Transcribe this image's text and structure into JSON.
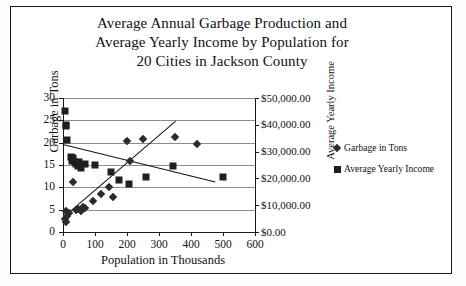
{
  "chart_data": {
    "type": "scatter",
    "title": "Average Annual Garbage Production and Average Yearly Income by Population for 20 Cities in Jackson County",
    "title_lines": [
      "Average Annual Garbage Production and",
      "Average Yearly Income by Population for",
      "20 Cities in Jackson County"
    ],
    "xlabel": "Population in Thousands",
    "ylabel": "Garbage in Tons",
    "y2label": "Average Yearly Income",
    "xlim": [
      0,
      600
    ],
    "ylim": [
      0,
      30
    ],
    "y2lim": [
      0,
      50000
    ],
    "grid": true,
    "legend_position": "right",
    "xticks": [
      0,
      100,
      200,
      300,
      400,
      500,
      600
    ],
    "xtick_labels": [
      "0",
      "100",
      "200",
      "300",
      "400",
      "500",
      "600"
    ],
    "yticks": [
      0,
      5,
      10,
      15,
      20,
      25,
      30
    ],
    "ytick_labels": [
      "0",
      "5",
      "10",
      "15",
      "20",
      "25",
      "30"
    ],
    "y2ticks": [
      0,
      10000,
      20000,
      30000,
      40000,
      50000
    ],
    "y2tick_labels": [
      "$0.00",
      "$10,000.00",
      "$20,000.00",
      "$30,000.00",
      "$40,000.00",
      "$50,000.00"
    ],
    "series": [
      {
        "name": "Garbage in Tons",
        "marker": "diamond",
        "axis": "left",
        "points": [
          {
            "x": 5,
            "y": 3.0
          },
          {
            "x": 8,
            "y": 2.3
          },
          {
            "x": 10,
            "y": 4.6
          },
          {
            "x": 14,
            "y": 3.6
          },
          {
            "x": 18,
            "y": 4.3
          },
          {
            "x": 30,
            "y": 11.2
          },
          {
            "x": 40,
            "y": 5.0
          },
          {
            "x": 48,
            "y": 5.2
          },
          {
            "x": 55,
            "y": 4.8
          },
          {
            "x": 62,
            "y": 5.6
          },
          {
            "x": 70,
            "y": 5.4
          },
          {
            "x": 95,
            "y": 7.0
          },
          {
            "x": 120,
            "y": 8.6
          },
          {
            "x": 145,
            "y": 10.1
          },
          {
            "x": 155,
            "y": 7.9
          },
          {
            "x": 200,
            "y": 20.4
          },
          {
            "x": 210,
            "y": 16.0
          },
          {
            "x": 250,
            "y": 20.9
          },
          {
            "x": 350,
            "y": 21.3
          },
          {
            "x": 420,
            "y": 19.7
          }
        ]
      },
      {
        "name": "Average Yearly Income",
        "marker": "square",
        "axis": "right",
        "points": [
          {
            "x": 5,
            "y": 45000
          },
          {
            "x": 8,
            "y": 40000
          },
          {
            "x": 10,
            "y": 39500
          },
          {
            "x": 14,
            "y": 34500
          },
          {
            "x": 25,
            "y": 28000
          },
          {
            "x": 28,
            "y": 26500
          },
          {
            "x": 32,
            "y": 27500
          },
          {
            "x": 36,
            "y": 26000
          },
          {
            "x": 42,
            "y": 25500
          },
          {
            "x": 46,
            "y": 24500
          },
          {
            "x": 50,
            "y": 26000
          },
          {
            "x": 55,
            "y": 24000
          },
          {
            "x": 70,
            "y": 25500
          },
          {
            "x": 100,
            "y": 25000
          },
          {
            "x": 150,
            "y": 22500
          },
          {
            "x": 175,
            "y": 19500
          },
          {
            "x": 205,
            "y": 18000
          },
          {
            "x": 260,
            "y": 20500
          },
          {
            "x": 345,
            "y": 24500
          },
          {
            "x": 500,
            "y": 20500
          }
        ]
      }
    ],
    "trendlines": [
      {
        "name": "garbage-trend",
        "axis": "left",
        "x0": 0,
        "y0": 3.3,
        "x1": 350,
        "y1": 24.8
      },
      {
        "name": "income-trend",
        "axis": "left",
        "x0": 0,
        "y0": 19.7,
        "x1": 475,
        "y1": 11.3
      }
    ]
  }
}
